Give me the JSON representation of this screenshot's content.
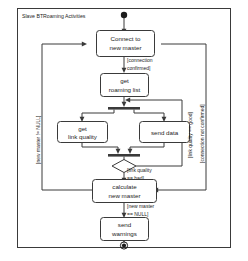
{
  "frame": {
    "title": "Slave BTRoaming Activities"
  },
  "colors": {
    "stroke": "#3a3a3a",
    "text": "#1c1c1c",
    "background": "#ffffff"
  },
  "diagram": {
    "type": "uml-activity-diagram",
    "nodes": [
      {
        "id": "initial",
        "kind": "initial-node",
        "label": ""
      },
      {
        "id": "connect",
        "kind": "activity",
        "line1": "Connect to",
        "line2": "new master"
      },
      {
        "id": "roaming",
        "kind": "activity",
        "line1": "get",
        "line2": "roaming list"
      },
      {
        "id": "fork",
        "kind": "fork-bar",
        "label": ""
      },
      {
        "id": "linkquality",
        "kind": "activity",
        "line1": "get",
        "line2": "link quality"
      },
      {
        "id": "senddata",
        "kind": "activity",
        "line1": "send data",
        "line2": ""
      },
      {
        "id": "join",
        "kind": "join-bar",
        "label": ""
      },
      {
        "id": "decision",
        "kind": "decision",
        "label": ""
      },
      {
        "id": "calculate",
        "kind": "activity",
        "line1": "calculate",
        "line2": "new master"
      },
      {
        "id": "warnings",
        "kind": "activity",
        "line1": "send",
        "line2": "warnings"
      },
      {
        "id": "final",
        "kind": "final-node",
        "label": ""
      }
    ],
    "guards": {
      "connection_confirmed_l1": "[connection",
      "connection_confirmed_l2": "confirmed]",
      "link_quality_bad_l1": "[link quality",
      "link_quality_bad_l2": "== bad]",
      "new_master_null_l1": "[new master",
      "new_master_null_l2": "== NULL]",
      "link_quality_good": "[link quality == good]",
      "connection_not_confirmed": "[connection not confirmed]",
      "new_master_not_null": "[new master != NULL]"
    }
  }
}
